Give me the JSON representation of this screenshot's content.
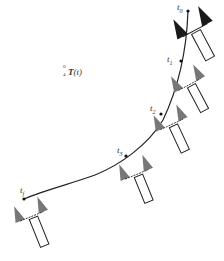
{
  "diagram": {
    "transform_label": {
      "superscript": "0",
      "subscript": "4",
      "symbol": "T",
      "argument": "(t)"
    },
    "waypoints": [
      {
        "label": "t",
        "sub": "0"
      },
      {
        "label": "t",
        "sub": "1"
      },
      {
        "label": "t",
        "sub": "2"
      },
      {
        "label": "t",
        "sub": "3"
      },
      {
        "label": "t",
        "sub": "f"
      }
    ],
    "colors": {
      "path": "#222222",
      "gripper_initial": "#1a1a1a",
      "gripper_intermediate": "#777777",
      "outline": "#222222",
      "background": "#ffffff"
    }
  }
}
